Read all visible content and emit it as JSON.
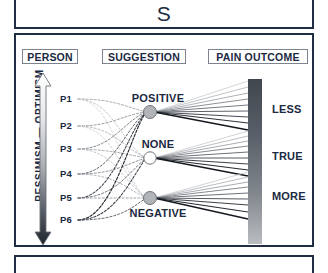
{
  "title": {
    "text": "S"
  },
  "diagram": {
    "columns": [
      {
        "id": "person",
        "label": "PERSON"
      },
      {
        "id": "suggestion",
        "label": "SUGGESTION"
      },
      {
        "id": "outcome",
        "label": "PAIN OUTCOME"
      }
    ],
    "axis": {
      "label": "PESSIMISM  —  OPTIMISM",
      "top_end": "OPTIMISM",
      "bottom_end": "PESSIMISM",
      "arrow": "double-headed-vertical-arrow",
      "gradient_top": "#ffffff",
      "gradient_bottom": "#20252c"
    },
    "persons": [
      {
        "id": "p1",
        "label": "P1",
        "y": 64
      },
      {
        "id": "p2",
        "label": "P2",
        "y": 91
      },
      {
        "id": "p3",
        "label": "P3",
        "y": 114
      },
      {
        "id": "p4",
        "label": "P4",
        "y": 139
      },
      {
        "id": "p5",
        "label": "P5",
        "y": 163
      },
      {
        "id": "p6",
        "label": "P6",
        "y": 185
      }
    ],
    "suggestions": [
      {
        "id": "positive",
        "label": "POSITIVE",
        "y": 77,
        "node_fill": "#b2b5b8",
        "label_position": "above"
      },
      {
        "id": "none",
        "label": "NONE",
        "y": 123,
        "node_fill": "#ffffff",
        "label_position": "above"
      },
      {
        "id": "negative",
        "label": "NEGATIVE",
        "y": 163,
        "node_fill": "#b2b5b8",
        "label_position": "below"
      }
    ],
    "outcomes": [
      {
        "id": "less",
        "label": "LESS",
        "y": 74
      },
      {
        "id": "true",
        "label": "TRUE",
        "y": 121
      },
      {
        "id": "more",
        "label": "MORE",
        "y": 161
      }
    ],
    "outcome_bar": {
      "gradient_top": "#41474f",
      "gradient_bottom": "#b9bcc0"
    }
  },
  "colors": {
    "border": "#1f2d45",
    "text": "#1b2a42",
    "chip_border": "#7d848f"
  },
  "bottom_panel": {
    "content": ""
  }
}
